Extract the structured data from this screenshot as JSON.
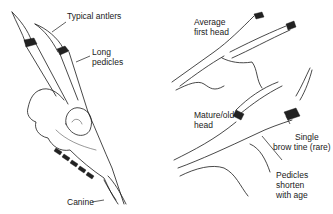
{
  "figure": {
    "panels": [
      {
        "id": "skull",
        "description": "Deer skull with antlers on long pedicles",
        "labels": [
          {
            "text": "Typical antlers"
          },
          {
            "text": "Long\npedicles",
            "lines": [
              "Long",
              "pedicles"
            ]
          },
          {
            "text": "Canine"
          }
        ]
      },
      {
        "id": "first-head",
        "labels": [
          {
            "text": "Average\nfirst head",
            "lines": [
              "Average",
              "first head"
            ]
          }
        ]
      },
      {
        "id": "mature-head",
        "labels": [
          {
            "text": "Mature/old\nhead",
            "lines": [
              "Mature/old",
              "head"
            ]
          },
          {
            "text": "Single\nbrow tine (rare)",
            "lines": [
              "Single",
              "brow tine (rare)"
            ]
          },
          {
            "text": "Pedicles\nshorten\nwith age",
            "lines": [
              "Pedicles",
              "shorten",
              "with age"
            ]
          }
        ]
      }
    ],
    "colors": {
      "ink": "#1a1a1a",
      "background": "#ffffff"
    }
  }
}
